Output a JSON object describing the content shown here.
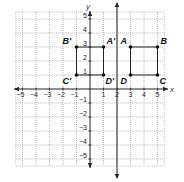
{
  "diagram": {
    "type": "coordinate-plane",
    "x_axis": {
      "label": "x",
      "min": -5,
      "max": 5,
      "ticks": [
        -5,
        -4,
        -3,
        -2,
        -1,
        1,
        2,
        3,
        4,
        5
      ]
    },
    "y_axis": {
      "label": "y",
      "min": -5,
      "max": 5,
      "ticks": [
        5,
        4,
        3,
        2,
        1,
        -1,
        -2,
        -3,
        -4,
        -5
      ]
    },
    "grid": {
      "on": true,
      "style": "dotted",
      "extent": [
        -5.5,
        5.5
      ]
    },
    "reflection_line": {
      "equation": "x = 2",
      "x": 2
    },
    "figures": [
      {
        "name": "ABCD",
        "points": [
          {
            "label": "A",
            "x": 3,
            "y": 3
          },
          {
            "label": "B",
            "x": 5,
            "y": 3
          },
          {
            "label": "C",
            "x": 5,
            "y": 1
          },
          {
            "label": "D",
            "x": 3,
            "y": 1
          }
        ]
      },
      {
        "name": "A'B'C'D'",
        "points": [
          {
            "label": "A'",
            "x": 1,
            "y": 3
          },
          {
            "label": "B'",
            "x": -1,
            "y": 3
          },
          {
            "label": "C'",
            "x": -1,
            "y": 1
          },
          {
            "label": "D'",
            "x": 1,
            "y": 1
          }
        ]
      }
    ],
    "colors": {
      "axis": "#222222",
      "grid": "#9a9a9a",
      "shape": "#222222",
      "point": "#111111"
    }
  }
}
